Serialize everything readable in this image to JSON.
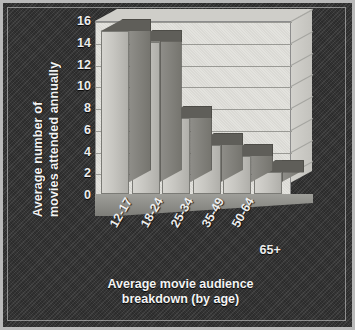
{
  "chart_data": {
    "type": "bar",
    "title": "",
    "subtitle": "",
    "categories": [
      "12-17",
      "18-24",
      "25-34",
      "35-49",
      "50-64",
      "65+"
    ],
    "values": [
      15,
      14,
      7,
      4.5,
      3.5,
      2
    ],
    "xlabel": "Average movie audience breakdown (by age)",
    "xlabel_lines": [
      "Average movie audience",
      "breakdown (by age)"
    ],
    "ylabel": "Average number of movies attended annually",
    "ylabel_lines": [
      "Average number of",
      "movies attended annually"
    ],
    "ylim": [
      0,
      16
    ],
    "ytick_values": [
      0,
      2,
      4,
      6,
      8,
      10,
      12,
      14,
      16
    ],
    "ytick_labels": [
      "0",
      "2",
      "4",
      "6",
      "8",
      "10",
      "12",
      "14",
      "16"
    ],
    "grid": true,
    "grid_axis": "y",
    "legend": false,
    "legend_position": "none",
    "style": "3d-bar",
    "colors": {
      "bar_face": "#c6c5c0",
      "bar_side": "#82817c",
      "bar_top": "#5f5e59",
      "plot_background": "#e2e1dc",
      "figure_background": "#343434",
      "text": "#f0f0f0",
      "gridline": "#9a9a95",
      "frame_border": "#b9b9b9"
    }
  }
}
